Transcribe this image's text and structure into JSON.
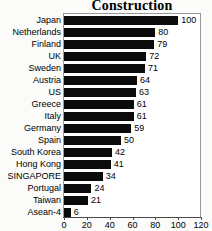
{
  "chart_data": {
    "type": "bar",
    "orientation": "horizontal",
    "title": "Construction",
    "xlabel": "",
    "ylabel": "",
    "xlim": [
      0,
      120
    ],
    "xticks": [
      0,
      20,
      40,
      60,
      80,
      100,
      120
    ],
    "grid": false,
    "legend": null,
    "bar_color": "#000000",
    "categories": [
      "Japan",
      "Netherlands",
      "Finland",
      "UK",
      "Sweden",
      "Austria",
      "US",
      "Greece",
      "Italy",
      "Germany",
      "Spain",
      "South Korea",
      "Hong Kong",
      "SINGAPORE",
      "Portugal",
      "Taiwan",
      "Asean-4"
    ],
    "values": [
      100,
      80,
      79,
      72,
      71,
      64,
      63,
      61,
      61,
      59,
      50,
      42,
      41,
      34,
      24,
      21,
      6
    ],
    "data_labels": [
      "100",
      "80",
      "79",
      "72",
      "71",
      "64",
      "63",
      "61",
      "61",
      "59",
      "50",
      "42",
      "41",
      "34",
      "24",
      "21",
      "6"
    ],
    "tick_labels": [
      "0",
      "20",
      "40",
      "60",
      "80",
      "100",
      "120"
    ]
  }
}
